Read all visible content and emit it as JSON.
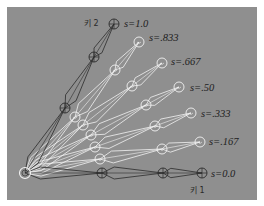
{
  "figure": {
    "background": "#8f8f8f",
    "frame": "#ffffff",
    "root": {
      "x": 25,
      "y": 173
    },
    "chains": [
      {
        "s_label": "s=0.0",
        "key_label": "키 1",
        "style": "dark",
        "joints": [
          [
            25,
            173
          ],
          [
            102,
            173
          ],
          [
            163,
            173
          ],
          [
            202,
            173
          ]
        ],
        "label_pos": [
          211,
          177
        ],
        "key_label_pos": [
          190,
          193
        ]
      },
      {
        "s_label": "s=.167",
        "style": "light",
        "joints": [
          [
            25,
            173
          ],
          [
            100,
            159
          ],
          [
            162,
            149
          ],
          [
            200,
            142
          ]
        ],
        "label_pos": [
          209,
          145
        ]
      },
      {
        "s_label": "s=.333",
        "style": "light",
        "joints": [
          [
            25,
            173
          ],
          [
            95,
            147
          ],
          [
            155,
            126
          ],
          [
            191,
            113
          ]
        ],
        "label_pos": [
          201,
          117
        ]
      },
      {
        "s_label": "s=.50",
        "style": "light",
        "joints": [
          [
            25,
            173
          ],
          [
            91,
            135
          ],
          [
            146,
            105
          ],
          [
            179,
            87
          ]
        ],
        "label_pos": [
          190,
          91
        ]
      },
      {
        "s_label": "s=.667",
        "style": "light",
        "joints": [
          [
            25,
            173
          ],
          [
            83,
            125
          ],
          [
            132,
            86
          ],
          [
            162,
            63
          ]
        ],
        "label_pos": [
          171,
          65
        ]
      },
      {
        "s_label": "s=.833",
        "style": "light",
        "joints": [
          [
            25,
            173
          ],
          [
            75,
            117
          ],
          [
            115,
            70
          ],
          [
            139,
            42
          ]
        ],
        "label_pos": [
          149,
          41
        ]
      },
      {
        "s_label": "s=1.0",
        "key_label": "키 2",
        "style": "dark",
        "joints": [
          [
            25,
            173
          ],
          [
            65,
            108
          ],
          [
            94,
            57
          ],
          [
            114,
            24
          ]
        ],
        "label_pos": [
          124,
          27
        ],
        "key_label_pos": [
          84,
          26
        ]
      }
    ],
    "colors": {
      "dark_line": "#2b2b2b",
      "light_line": "#f2f2f2",
      "label": "#1e1e1e"
    }
  }
}
